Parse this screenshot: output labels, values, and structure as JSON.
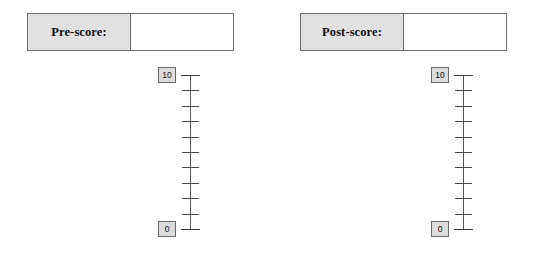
{
  "document": {
    "title": "Pre-score and Post-score rating scales",
    "background_color": "#ffffff"
  },
  "style_tokens": {
    "label_cell_fill": "#e1e1e1",
    "endpoint_box_fill": "#dcdcdc",
    "border_color": "#6e6e6e",
    "tick_color": "#4a4a4a",
    "text_color": "#111111",
    "input_cell_fill": "#ffffff"
  },
  "panels": [
    {
      "id": "pre",
      "field": {
        "label": "Pre-score:",
        "value": "",
        "placeholder": ""
      },
      "scale": {
        "max_label": "10",
        "min_label": "0",
        "orientation": "vertical",
        "tick_count": 11,
        "interval_count": 10
      }
    },
    {
      "id": "post",
      "field": {
        "label": "Post-score:",
        "value": "",
        "placeholder": ""
      },
      "scale": {
        "max_label": "10",
        "min_label": "0",
        "orientation": "vertical",
        "tick_count": 11,
        "interval_count": 10
      }
    }
  ]
}
